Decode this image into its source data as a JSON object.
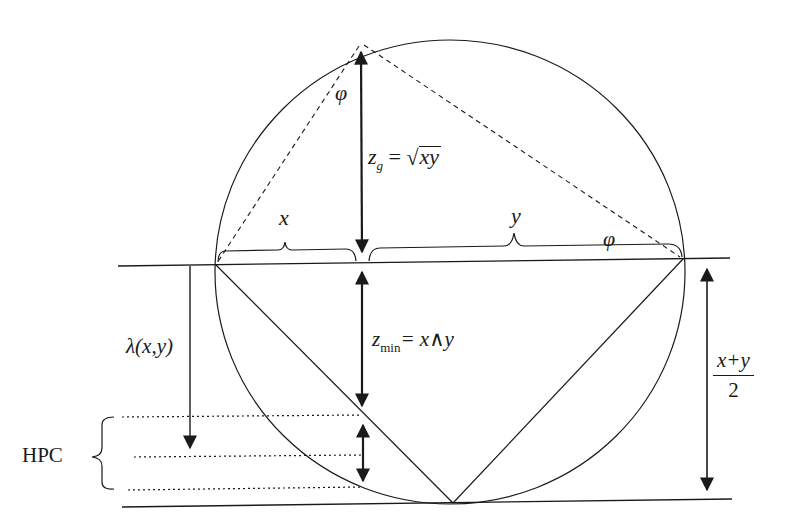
{
  "diagram": {
    "labels": {
      "phi_top": "φ",
      "phi_right": "φ",
      "zg_var": "z",
      "zg_sub": "g",
      "zg_eq": " = ",
      "zg_radicand": "xy",
      "x_brace": "x",
      "y_brace": "y",
      "zmin_var": "z",
      "zmin_sub": "min",
      "zmin_rhs": "= x∧y",
      "lambda": "λ(x,y)",
      "frac_num": "x+y",
      "frac_den": "2",
      "hpc": "HPC"
    },
    "colors": {
      "stroke": "#1a1a1a",
      "background": "#ffffff"
    },
    "geometry": {
      "circle": {
        "cx": 450,
        "cy": 272,
        "rx": 235,
        "ry": 232
      },
      "top_point": [
        361,
        43
      ],
      "left_chord_point": [
        216,
        265
      ],
      "right_chord_point": [
        683,
        259
      ],
      "foot_point": [
        362,
        262
      ],
      "bottom_point": [
        453,
        503
      ],
      "hpc_levels_y": [
        416,
        457,
        489
      ]
    }
  }
}
